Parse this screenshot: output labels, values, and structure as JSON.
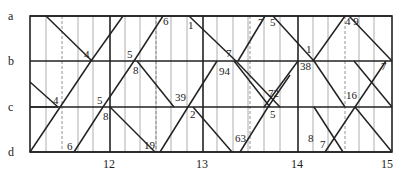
{
  "diagram": {
    "type": "train-timetable-graph",
    "rows": [
      {
        "label": "a",
        "y": 16
      },
      {
        "label": "b",
        "y": 61
      },
      {
        "label": "c",
        "y": 107
      },
      {
        "label": "d",
        "y": 152
      }
    ],
    "x_axis": {
      "ticks": [
        {
          "label": "12",
          "x": 110
        },
        {
          "label": "13",
          "x": 201
        },
        {
          "label": "14",
          "x": 298
        },
        {
          "label": "15",
          "x": 388
        }
      ]
    },
    "annotations": [
      {
        "text": "4",
        "x": 84,
        "y": 58
      },
      {
        "text": "5",
        "x": 128,
        "y": 58
      },
      {
        "text": "8",
        "x": 133,
        "y": 74
      },
      {
        "text": "6",
        "x": 163,
        "y": 25
      },
      {
        "text": "1",
        "x": 189,
        "y": 29
      },
      {
        "text": "7",
        "x": 226,
        "y": 57
      },
      {
        "text": "7",
        "x": 258,
        "y": 26
      },
      {
        "text": "94",
        "x": 219,
        "y": 75
      },
      {
        "text": "5",
        "x": 271,
        "y": 26
      },
      {
        "text": "1",
        "x": 306,
        "y": 53
      },
      {
        "text": "38",
        "x": 300,
        "y": 70
      },
      {
        "text": "4 9",
        "x": 345,
        "y": 25
      },
      {
        "text": "7",
        "x": 380,
        "y": 70
      },
      {
        "text": "4",
        "x": 55,
        "y": 104
      },
      {
        "text": "5",
        "x": 97,
        "y": 104
      },
      {
        "text": "8",
        "x": 103,
        "y": 120
      },
      {
        "text": "39",
        "x": 176,
        "y": 101
      },
      {
        "text": "2",
        "x": 190,
        "y": 118
      },
      {
        "text": "72",
        "x": 270,
        "y": 97
      },
      {
        "text": "5",
        "x": 270,
        "y": 118
      },
      {
        "text": "16",
        "x": 347,
        "y": 99
      },
      {
        "text": "6",
        "x": 68,
        "y": 151
      },
      {
        "text": "19",
        "x": 145,
        "y": 149
      },
      {
        "text": "63",
        "x": 236,
        "y": 142
      },
      {
        "text": "8",
        "x": 308,
        "y": 142
      },
      {
        "text": "7",
        "x": 321,
        "y": 148
      }
    ]
  }
}
